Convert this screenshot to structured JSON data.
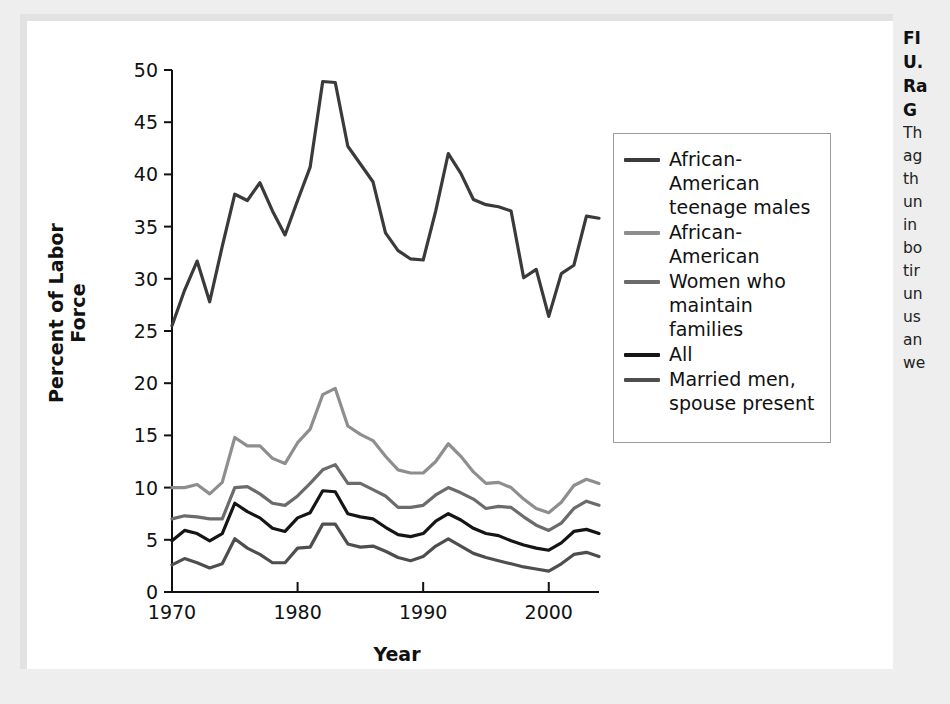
{
  "figure": {
    "panel_bg": "#ffffff",
    "page_bg": "#eeeeee"
  },
  "axes": {
    "ylabel": "Percent of Labor Force",
    "xlabel": "Year",
    "yticks": [
      "0",
      "5",
      "10",
      "15",
      "20",
      "25",
      "30",
      "35",
      "40",
      "45",
      "50"
    ],
    "xticks": [
      "1970",
      "1980",
      "1990",
      "2000"
    ]
  },
  "legend": {
    "items": [
      {
        "label": "African-American teenage males",
        "color": "#3a3a3a"
      },
      {
        "label": "African-American",
        "color": "#8e8e8e"
      },
      {
        "label": "Women who maintain families",
        "color": "#6b6b6b"
      },
      {
        "label": "All",
        "color": "#151515"
      },
      {
        "label": "Married men, spouse present",
        "color": "#4e4e4e"
      }
    ]
  },
  "caption": {
    "title_lines": [
      "FI",
      "U.",
      "Ra",
      "G"
    ],
    "body_lines": [
      "Th",
      "ag",
      "th",
      "un",
      "in",
      "bo",
      "tir",
      "un",
      "us",
      "an",
      "we"
    ]
  },
  "chart_data": {
    "type": "line",
    "title": "",
    "xlabel": "Year",
    "ylabel": "Percent of Labor Force",
    "xlim": [
      1970,
      2004
    ],
    "ylim": [
      0,
      50
    ],
    "grid": false,
    "legend_position": "right",
    "x": [
      1970,
      1971,
      1972,
      1973,
      1974,
      1975,
      1976,
      1977,
      1978,
      1979,
      1980,
      1981,
      1982,
      1983,
      1984,
      1985,
      1986,
      1987,
      1988,
      1989,
      1990,
      1991,
      1992,
      1993,
      1994,
      1995,
      1996,
      1997,
      1998,
      1999,
      2000,
      2001,
      2002,
      2003,
      2004
    ],
    "series": [
      {
        "name": "African-American teenage males",
        "color": "#3a3a3a",
        "values": [
          25.5,
          28.9,
          31.7,
          27.8,
          33.1,
          38.1,
          37.5,
          39.2,
          36.5,
          34.2,
          37.5,
          40.7,
          48.9,
          48.8,
          42.7,
          41.0,
          39.3,
          34.4,
          32.7,
          31.9,
          31.8,
          36.5,
          42.0,
          40.1,
          37.6,
          37.1,
          36.9,
          36.5,
          30.1,
          30.9,
          26.4,
          30.5,
          31.3,
          36.0,
          35.8
        ]
      },
      {
        "name": "African-American",
        "color": "#8e8e8e",
        "values": [
          10.0,
          10.0,
          10.3,
          9.4,
          10.5,
          14.8,
          14.0,
          14.0,
          12.8,
          12.3,
          14.3,
          15.6,
          18.9,
          19.5,
          15.9,
          15.1,
          14.5,
          13.0,
          11.7,
          11.4,
          11.4,
          12.5,
          14.2,
          13.0,
          11.5,
          10.4,
          10.5,
          10.0,
          8.9,
          8.0,
          7.6,
          8.6,
          10.2,
          10.8,
          10.4
        ]
      },
      {
        "name": "Women who maintain families",
        "color": "#6b6b6b",
        "values": [
          7.0,
          7.3,
          7.2,
          7.0,
          7.0,
          10.0,
          10.1,
          9.4,
          8.5,
          8.3,
          9.2,
          10.4,
          11.7,
          12.2,
          10.4,
          10.4,
          9.8,
          9.2,
          8.1,
          8.1,
          8.3,
          9.3,
          10.0,
          9.5,
          8.9,
          8.0,
          8.2,
          8.1,
          7.2,
          6.4,
          5.9,
          6.6,
          8.0,
          8.7,
          8.3
        ]
      },
      {
        "name": "All",
        "color": "#151515",
        "values": [
          4.9,
          5.9,
          5.6,
          4.9,
          5.6,
          8.5,
          7.7,
          7.1,
          6.1,
          5.8,
          7.1,
          7.6,
          9.7,
          9.6,
          7.5,
          7.2,
          7.0,
          6.2,
          5.5,
          5.3,
          5.6,
          6.8,
          7.5,
          6.9,
          6.1,
          5.6,
          5.4,
          4.9,
          4.5,
          4.2,
          4.0,
          4.7,
          5.8,
          6.0,
          5.6
        ]
      },
      {
        "name": "Married men, spouse present",
        "color": "#4e4e4e",
        "values": [
          2.6,
          3.2,
          2.8,
          2.3,
          2.7,
          5.1,
          4.2,
          3.6,
          2.8,
          2.8,
          4.2,
          4.3,
          6.5,
          6.5,
          4.6,
          4.3,
          4.4,
          3.9,
          3.3,
          3.0,
          3.4,
          4.4,
          5.1,
          4.4,
          3.7,
          3.3,
          3.0,
          2.7,
          2.4,
          2.2,
          2.0,
          2.7,
          3.6,
          3.8,
          3.4
        ]
      }
    ]
  }
}
